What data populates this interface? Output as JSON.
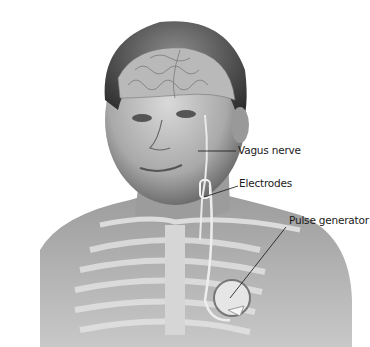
{
  "figure": {
    "labels": [
      {
        "id": "vagus",
        "text": "Vagus nerve"
      },
      {
        "id": "electrodes",
        "text": "Electrodes"
      },
      {
        "id": "pulse",
        "text": "Pulse generator"
      }
    ]
  }
}
